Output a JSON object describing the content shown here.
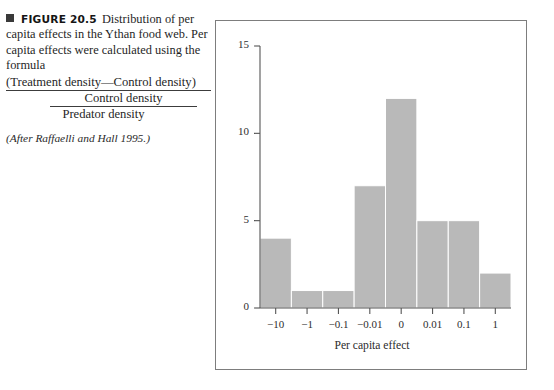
{
  "caption": {
    "marker_icon": "filled-square-icon",
    "figure_label": "FIGURE 20.5",
    "body_text": "Distribution of per capita effects in the Ythan food web. Per capita effects were calculated using the formula",
    "formula": {
      "numerator_inner": "(Treatment density—Control density)",
      "denominator_inner": "Control density",
      "denominator_outer": "Predator density"
    },
    "attribution": "(After Raffaelli and Hall 1995.)"
  },
  "chart_data": {
    "type": "bar",
    "title": "",
    "subtitle": "",
    "categories": [
      "−10",
      "−1",
      "−0.1",
      "−0.01",
      "0",
      "0.01",
      "0.1",
      "1"
    ],
    "values": [
      4,
      1,
      1,
      7,
      12,
      5,
      5,
      2
    ],
    "xlabel": "Per capita effect",
    "ylabel": "",
    "ylim": [
      0,
      15
    ],
    "yticks": [
      0,
      5,
      10,
      15
    ],
    "ytick_labels": [
      "0",
      "5",
      "10",
      "15"
    ],
    "grid": false,
    "legend": false,
    "bar_color": "#b9b9b9",
    "axis_color": "#555555",
    "frame_color": "#7d7d7d"
  }
}
